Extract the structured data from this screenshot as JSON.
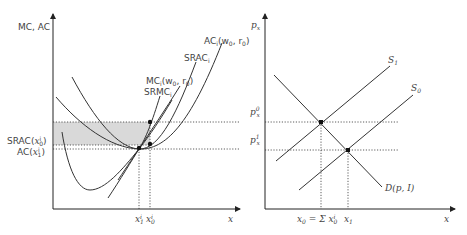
{
  "left_panel": {
    "y_axis_label": "MC, AC",
    "x_axis_label": "x",
    "curve_labels": {
      "ac_long_run": "AC",
      "ac_long_run_sub": "i",
      "ac_long_run_args": "(w",
      "ac_long_run_args2": "0",
      "ac_long_run_args3": ", r",
      "ac_long_run_args4": "0",
      "ac_long_run_args5": ")",
      "srac": "SRAC",
      "srac_sub": "i",
      "mc_long_run": "MC",
      "mc_long_run_sub": "i",
      "mc_long_run_args": "(w",
      "mc_long_run_args2": "0",
      "mc_long_run_args3": ", r",
      "mc_long_run_args4": "0",
      "mc_long_run_args5": ")",
      "srmc": "SRMC",
      "srmc_sub": "i"
    },
    "y_tick_labels": {
      "srac_x0": "SRAC(",
      "srac_x0_var": "x",
      "srac_x0_sup": "i",
      "srac_x0_sub": "0",
      "srac_x0_close": ")",
      "ac_x1": "AC(",
      "ac_x1_var": "x",
      "ac_x1_sup": "i",
      "ac_x1_sub": "1",
      "ac_x1_close": ")"
    },
    "x_tick_labels": {
      "x1i": "x",
      "x1i_sup": "i",
      "x1i_sub": "1",
      "x0i": "x",
      "x0i_sup": "i",
      "x0i_sub": "0"
    },
    "shaded_region_color": "#d9d9d9"
  },
  "right_panel": {
    "y_axis_label": "p",
    "y_axis_label_sub": "x",
    "x_axis_label": "x",
    "curve_labels": {
      "s1": "S",
      "s1_sub": "1",
      "s0": "S",
      "s0_sub": "0",
      "demand": "D(p, I)"
    },
    "y_tick_labels": {
      "p0": "p",
      "p0_sub": "x",
      "p0_sup": "0",
      "p1": "p",
      "p1_sub": "x",
      "p1_sup": "1"
    },
    "x_tick_labels": {
      "x0_sum": "x",
      "x0_sum_sub": "0",
      "x0_sum_eq": " = Σ x",
      "x0_sum_sup": "i",
      "x0_sum_sub2": "0",
      "x1": "x",
      "x1_sub": "1"
    }
  }
}
